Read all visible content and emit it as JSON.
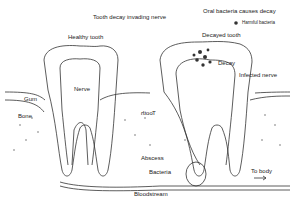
{
  "diagram": {
    "title_left": "Tooth decay invading nerve",
    "title_right": "Oral bacteria causes decay",
    "legend": {
      "marker": "dot",
      "label": "Harmful bacteria",
      "color": "#333333"
    },
    "healthy": {
      "title": "Healthy tooth",
      "labels": {
        "nerve": "Nerve",
        "gum": "Gum",
        "bone": "Bone"
      }
    },
    "decayed": {
      "title": "Decayed tooth",
      "labels": {
        "decay": "Decay",
        "infected_nerve": "Infected nerve",
        "tooth_mirrored": "Tooth",
        "abscess": "Abscess",
        "bacteria": "Bacteria",
        "to_body": "To body",
        "bloodstream": "Bloodstream"
      }
    },
    "colors": {
      "line": "#333333",
      "background": "#ffffff"
    }
  }
}
